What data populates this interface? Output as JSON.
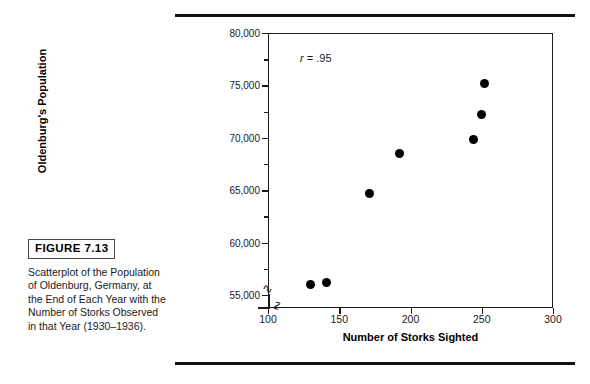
{
  "figure": {
    "badge_label": "FIGURE 7.13",
    "caption": "Scatterplot of the Population of Oldenburg, Germany, at the End of Each Year with the Number of Storks Observed in that Year (1930–1936)."
  },
  "chart_data": {
    "type": "scatter",
    "title": "",
    "xlabel": "Number of Storks Sighted",
    "ylabel": "Oldenburg's Population",
    "xlim": [
      100,
      300
    ],
    "ylim": [
      53750,
      80000
    ],
    "xticks": [
      100,
      150,
      200,
      250,
      300
    ],
    "xtick_labels": [
      "100",
      "150",
      "200",
      "250",
      "300"
    ],
    "yticks": [
      55000,
      60000,
      65000,
      70000,
      75000,
      80000
    ],
    "ytick_labels": [
      "55,000",
      "60,000",
      "65,000",
      "70,000",
      "75,000",
      "80,000"
    ],
    "yticks_minor": [
      57500,
      62500,
      67500,
      72500,
      77500
    ],
    "grid": false,
    "legend": null,
    "axis_break_x": true,
    "axis_break_y": true,
    "annotations": [
      {
        "symbol": "r",
        "text": "= .95",
        "x": 128,
        "y": 77600
      }
    ],
    "series": [
      {
        "name": "Oldenburg population vs storks sighted",
        "marker": "filled-circle",
        "color": "#000000",
        "points": [
          {
            "x": 130,
            "y": 56000
          },
          {
            "x": 141,
            "y": 56200
          },
          {
            "x": 171,
            "y": 64700
          },
          {
            "x": 192,
            "y": 68500
          },
          {
            "x": 244,
            "y": 69800
          },
          {
            "x": 250,
            "y": 72200
          },
          {
            "x": 252,
            "y": 75200
          }
        ]
      }
    ]
  }
}
